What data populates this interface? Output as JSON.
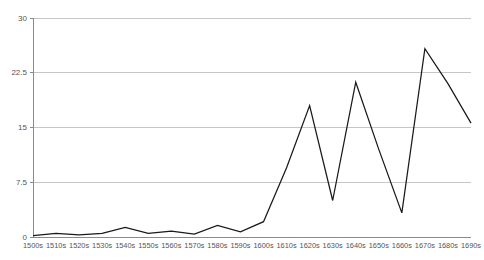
{
  "chart_data": {
    "type": "line",
    "title": "",
    "subtitle": "",
    "xlabel": "",
    "ylabel": "",
    "categories": [
      "1500s",
      "1510s",
      "1520s",
      "1530s",
      "1540s",
      "1550s",
      "1560s",
      "1570s",
      "1580s",
      "1590s",
      "1600s",
      "1610s",
      "1620s",
      "1630s",
      "1640s",
      "1650s",
      "1660s",
      "1670s",
      "1680s",
      "1690s"
    ],
    "values": [
      0.2,
      0.5,
      0.3,
      0.5,
      1.3,
      0.5,
      0.8,
      0.4,
      1.6,
      0.7,
      2.1,
      9.5,
      18.0,
      5.0,
      21.2,
      12.0,
      3.3,
      25.8,
      21.0,
      15.6
    ],
    "series": [
      {
        "name": "series-1",
        "color": "#1a1a1a",
        "values": [
          0.2,
          0.5,
          0.3,
          0.5,
          1.3,
          0.5,
          0.8,
          0.4,
          1.6,
          0.7,
          2.1,
          9.5,
          18.0,
          5.0,
          21.2,
          12.0,
          3.3,
          25.8,
          21.0,
          15.6
        ]
      }
    ],
    "ylim": [
      0,
      30
    ],
    "yticks": [
      0,
      7.5,
      15,
      22.5,
      30
    ],
    "ytick_labels": [
      "0",
      "7.5",
      "15",
      "22.5",
      "30"
    ],
    "grid": true,
    "grid_axis": "y",
    "legend": false,
    "legend_position": "none",
    "annotations": []
  },
  "style": {
    "line_color": "#1a1a1a",
    "grid_color": "#b8b8b8",
    "axis_color": "#8a8a8a",
    "tick_label_color": "#555555",
    "background_color": "#ffffff"
  }
}
